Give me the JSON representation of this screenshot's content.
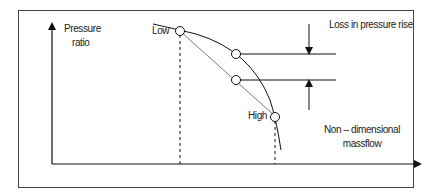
{
  "diagram": {
    "type": "compressor characteristic",
    "axes": {
      "y_label_line1": "Pressure",
      "y_label_line2": "ratio",
      "x_label_line1": "Non – dimensional",
      "x_label_line2": "massflow"
    },
    "points": {
      "low_label": "Low",
      "high_label": "High"
    },
    "annotation": "Loss in pressure rise",
    "colors": {
      "line": "#1a1a1a",
      "frame": "#333333",
      "background": "#ffffff"
    }
  }
}
